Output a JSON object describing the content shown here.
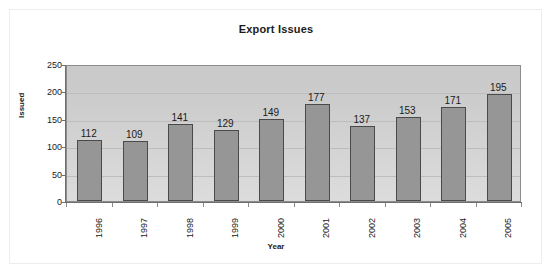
{
  "chart_data": {
    "type": "bar",
    "title": "Export Issues",
    "xlabel": "Year",
    "ylabel": "Issued",
    "categories": [
      "1996",
      "1997",
      "1998",
      "1999",
      "2000",
      "2001",
      "2002",
      "2003",
      "2004",
      "2005"
    ],
    "values": [
      112,
      109,
      141,
      129,
      149,
      177,
      137,
      153,
      171,
      195
    ],
    "data_labels": [
      "112",
      "109",
      "141",
      "129",
      "149",
      "177",
      "137",
      "153",
      "171",
      "195"
    ],
    "ylim": [
      0,
      250
    ],
    "ytick_values": [
      0,
      50,
      100,
      150,
      200,
      250
    ],
    "ytick_labels": [
      "0",
      "50",
      "100",
      "150",
      "200",
      "250"
    ],
    "grid": true,
    "legend": "none",
    "colors": {
      "bar_fill": "#969696",
      "bar_border": "#4a4a4a",
      "plot_background": "#d0d0d0",
      "gridline": "#bdbdbd",
      "axis": "#6e6e6e",
      "text": "#1a1a1a",
      "page_background": "#ffffff"
    }
  }
}
